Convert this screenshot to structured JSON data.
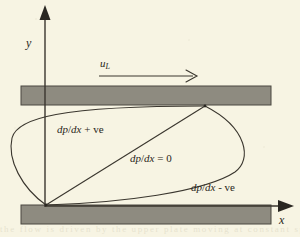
{
  "figure": {
    "background_color": "#f7f4e3",
    "ink_color": "#2a2721",
    "plate_fill_color": "#8e8b80",
    "plate_stroke_color": "#4a4740"
  },
  "axes": {
    "y_label": "y",
    "x_label": "x",
    "y_axis_name": "vertical-axis",
    "x_axis_name": "horizontal-axis",
    "arrowhead_style": "solid-triangle"
  },
  "velocity_arrow": {
    "symbol": "u",
    "subscript": "L",
    "name": "upper-plate-velocity-arrow",
    "direction": "right"
  },
  "plates": {
    "top": {
      "name": "top-plate",
      "fill": "#8e8b80"
    },
    "bottom": {
      "name": "bottom-plate",
      "fill": "#8e8b80"
    }
  },
  "profiles": [
    {
      "id": "positive",
      "label_numerator": "dp",
      "label_denominator": "dx",
      "label_suffix": "+ ve",
      "label_text": "dp/dx + ve",
      "description": "adverse pressure gradient profile bulging left",
      "name": "profile-curve-positive"
    },
    {
      "id": "zero",
      "label_numerator": "dp",
      "label_denominator": "dx",
      "label_suffix": "= 0",
      "label_text": "dp/dx = 0",
      "description": "linear Couette profile, zero pressure gradient",
      "name": "profile-curve-zero"
    },
    {
      "id": "negative",
      "label_numerator": "dp",
      "label_denominator": "dx",
      "label_suffix": "- ve",
      "label_text": "dp/dx - ve",
      "description": "favourable pressure gradient profile bulging right",
      "name": "profile-curve-negative"
    }
  ],
  "bleed_through": {
    "text": "the flow is driven by the upper plate moving at constant speed"
  }
}
